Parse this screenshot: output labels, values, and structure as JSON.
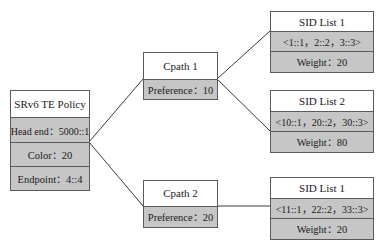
{
  "policy": {
    "title": "SRv6 TE Policy",
    "head_end": "Head end：5000::1",
    "color": "Color：20",
    "endpoint": "Endpoint：4::4"
  },
  "cpaths": [
    {
      "title": "Cpath 1",
      "preference": "Preference：10"
    },
    {
      "title": "Cpath 2",
      "preference": "Preference：20"
    }
  ],
  "sid_lists": [
    {
      "title": "SID List 1",
      "sids": "<1::1，2::2，3::3>",
      "weight": "Weight：20"
    },
    {
      "title": "SID List 2",
      "sids": "<10::1，20::2，30::3>",
      "weight": "Weight：80"
    },
    {
      "title": "SID List 1",
      "sids": "<11::1，22::2，33::3>",
      "weight": "Weight：20"
    }
  ],
  "colors": {
    "border": "#5a5a5a",
    "header_fill": "#ffffff",
    "row_fill": "#c6c6c6",
    "line": "#3a3a3a"
  }
}
